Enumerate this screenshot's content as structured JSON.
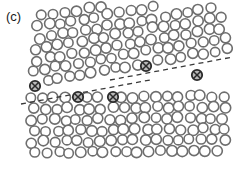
{
  "figure": {
    "panel_label": "(c)",
    "canvas": {
      "width": 233,
      "height": 169,
      "background": "#ffffff"
    }
  },
  "style": {
    "atom_stroke": "#6e6e6e",
    "atom_fill": "#ffffff",
    "atom_stroke_width": 1.6,
    "atom_radius": 5.0,
    "marked_atom_stroke": "#2b2b2b",
    "marked_atom_fill": "#b8b8b8",
    "marked_atom_stroke_width": 1.8,
    "marked_atom_radius": 5.2,
    "dashed_line_color": "#3a3a3a",
    "dashed_line_width": 1.3,
    "dash_pattern": "5,4",
    "label_color": "#1a1a1a"
  },
  "boundary_lines": [
    {
      "name": "upper-boundary-line",
      "x1": 110,
      "y1": 80,
      "x2": 233,
      "y2": 57
    },
    {
      "name": "lower-boundary-line",
      "x1": 21,
      "y1": 104,
      "x2": 150,
      "y2": 80
    }
  ],
  "dislocations": [
    {
      "id": "d1",
      "x": 35,
      "y": 86
    },
    {
      "id": "d2",
      "x": 78,
      "y": 97
    },
    {
      "id": "d3",
      "x": 113,
      "y": 97
    },
    {
      "id": "d4",
      "x": 146,
      "y": 66
    },
    {
      "id": "d5",
      "x": 197,
      "y": 75
    }
  ],
  "atoms": {
    "upper_region_rows": [
      {
        "y": 16,
        "x_start": 42,
        "count": 16,
        "dx": 11.6,
        "skew": 0.0
      },
      {
        "y": 27,
        "x_start": 37,
        "count": 17,
        "dx": 11.6,
        "skew": 0.0
      },
      {
        "y": 38,
        "x_start": 40,
        "count": 17,
        "dx": 11.3,
        "skew": 0.0
      },
      {
        "y": 49,
        "x_start": 35,
        "count": 17,
        "dx": 11.6,
        "skew": 0.0
      },
      {
        "y": 60,
        "x_start": 38,
        "count": 17,
        "dx": 11.4,
        "skew": 0.0
      },
      {
        "y": 71,
        "x_start": 33,
        "count": 18,
        "dx": 11.3,
        "skew": 0.0
      },
      {
        "y": 82,
        "x_start": 36,
        "count": 18,
        "dx": 11.2,
        "skew": 0.0
      }
    ],
    "lower_region_rows": [
      {
        "y": 98,
        "x_start": 30,
        "count": 18,
        "dx": 11.4,
        "skew": 0.0
      },
      {
        "y": 109,
        "x_start": 34,
        "count": 18,
        "dx": 11.2,
        "skew": 0.0
      },
      {
        "y": 120,
        "x_start": 31,
        "count": 18,
        "dx": 11.3,
        "skew": 0.0
      },
      {
        "y": 131,
        "x_start": 35,
        "count": 18,
        "dx": 11.2,
        "skew": 0.0
      },
      {
        "y": 142,
        "x_start": 32,
        "count": 18,
        "dx": 11.3,
        "skew": 0.0
      },
      {
        "y": 153,
        "x_start": 36,
        "count": 17,
        "dx": 11.3,
        "skew": 0.0
      }
    ]
  }
}
